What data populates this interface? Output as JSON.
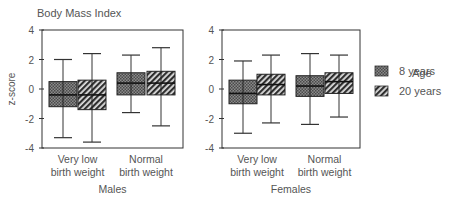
{
  "chart_data": {
    "type": "boxplot",
    "title": "Body Mass Index",
    "ylabel": "z-score",
    "ylim": [
      -4,
      4
    ],
    "yticks": [
      4,
      2,
      0,
      -2,
      -4
    ],
    "grid": false,
    "legend": {
      "title": "Age",
      "position": "right",
      "entries": [
        {
          "label": "8 years",
          "pattern": "crosshatch-dark"
        },
        {
          "label": "20 years",
          "pattern": "diagonal-stripes"
        }
      ]
    },
    "panels": [
      {
        "name": "Males",
        "categories": [
          "Very low birth weight",
          "Normal birth weight"
        ],
        "category_lines": [
          [
            "Very low",
            "birth weight"
          ],
          [
            "Normal",
            "birth weight"
          ]
        ],
        "series": [
          {
            "name": "8 years",
            "boxes": [
              {
                "whisker_low": -3.3,
                "q1": -1.2,
                "median": -0.4,
                "q3": 0.5,
                "whisker_high": 2.0
              },
              {
                "whisker_low": -1.6,
                "q1": -0.4,
                "median": 0.4,
                "q3": 1.1,
                "whisker_high": 2.3
              }
            ]
          },
          {
            "name": "20 years",
            "boxes": [
              {
                "whisker_low": -3.6,
                "q1": -1.4,
                "median": -0.4,
                "q3": 0.6,
                "whisker_high": 2.4
              },
              {
                "whisker_low": -2.5,
                "q1": -0.4,
                "median": 0.4,
                "q3": 1.2,
                "whisker_high": 2.8
              }
            ]
          }
        ]
      },
      {
        "name": "Females",
        "categories": [
          "Very low birth weight",
          "Normal birth weight"
        ],
        "category_lines": [
          [
            "Very low",
            "birth weight"
          ],
          [
            "Normal",
            "birth weight"
          ]
        ],
        "series": [
          {
            "name": "8 years",
            "boxes": [
              {
                "whisker_low": -3.0,
                "q1": -1.0,
                "median": -0.3,
                "q3": 0.6,
                "whisker_high": 1.9
              },
              {
                "whisker_low": -2.4,
                "q1": -0.5,
                "median": 0.2,
                "q3": 0.9,
                "whisker_high": 2.4
              }
            ]
          },
          {
            "name": "20 years",
            "boxes": [
              {
                "whisker_low": -2.3,
                "q1": -0.4,
                "median": 0.3,
                "q3": 1.0,
                "whisker_high": 2.3
              },
              {
                "whisker_low": -1.9,
                "q1": -0.3,
                "median": 0.5,
                "q3": 1.1,
                "whisker_high": 2.3
              }
            ]
          }
        ]
      }
    ]
  },
  "colors": {
    "axis": "#333333",
    "text": "#555555",
    "box_dark": "#5a5a5a",
    "box_light": "#d8d8d8"
  }
}
